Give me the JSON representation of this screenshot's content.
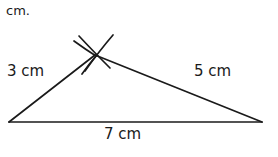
{
  "figure": {
    "header_note": "cm.",
    "background_color": "#ffffff",
    "stroke_color": "#1a1a1a",
    "width": 278,
    "height": 157,
    "labels": {
      "left_side": "3 cm",
      "right_side": "5 cm",
      "bottom_side": "7 cm"
    },
    "geometry": {
      "type": "triangle-with-compass-construction-arcs",
      "vertices": {
        "left": {
          "x": 9,
          "y": 122
        },
        "right": {
          "x": 262,
          "y": 122
        },
        "apex": {
          "x": 95,
          "y": 55
        }
      },
      "sides": [
        {
          "name": "left-side",
          "from": "left",
          "to": "apex",
          "length_label": "3 cm"
        },
        {
          "name": "right-side",
          "from": "apex",
          "to": "right",
          "length_label": "5 cm"
        },
        {
          "name": "bottom-side",
          "from": "left",
          "to": "right",
          "length_label": "7 cm"
        }
      ],
      "construction_arcs": [
        {
          "name": "arc-from-left-vertex",
          "radius_label": "3 cm",
          "sweep": "crossing at apex"
        },
        {
          "name": "arc-from-right-vertex",
          "radius_label": "5 cm",
          "sweep": "crossing at apex"
        }
      ]
    }
  }
}
